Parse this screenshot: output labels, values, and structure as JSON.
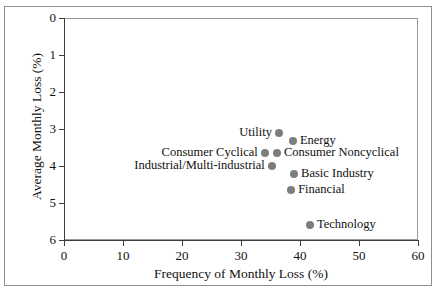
{
  "chart_data": {
    "type": "scatter",
    "title": "",
    "xlabel": "Frequency of Monthly Loss (%)",
    "ylabel": "Average Monthly Loss (%)",
    "xlim": [
      0,
      60
    ],
    "ylim": [
      0,
      6
    ],
    "y_inverted": true,
    "grid": false,
    "legend": "none",
    "marker_color": "#7d7d7d",
    "xticks": [
      "0",
      "10",
      "20",
      "30",
      "40",
      "50",
      "60"
    ],
    "xtick_values": [
      0,
      10,
      20,
      30,
      40,
      50,
      60
    ],
    "yticks": [
      "0",
      "1",
      "2",
      "3",
      "4",
      "5",
      "6"
    ],
    "ytick_values": [
      0,
      1,
      2,
      3,
      4,
      5,
      6
    ],
    "points": [
      {
        "label": "Utility",
        "x": 36.5,
        "y": 3.1,
        "label_side": "left"
      },
      {
        "label": "Energy",
        "x": 38.8,
        "y": 3.32,
        "label_side": "right"
      },
      {
        "label": "Consumer Cyclical",
        "x": 34.0,
        "y": 3.66,
        "label_side": "left"
      },
      {
        "label": "Consumer Noncyclical",
        "x": 36.1,
        "y": 3.66,
        "label_side": "right"
      },
      {
        "label": "Industrial/Multi-industrial",
        "x": 35.3,
        "y": 4.0,
        "label_side": "left"
      },
      {
        "label": "Basic Industry",
        "x": 39.0,
        "y": 4.22,
        "label_side": "right"
      },
      {
        "label": "Financial",
        "x": 38.5,
        "y": 4.64,
        "label_side": "right"
      },
      {
        "label": "Technology",
        "x": 41.7,
        "y": 5.6,
        "label_side": "right"
      }
    ]
  }
}
